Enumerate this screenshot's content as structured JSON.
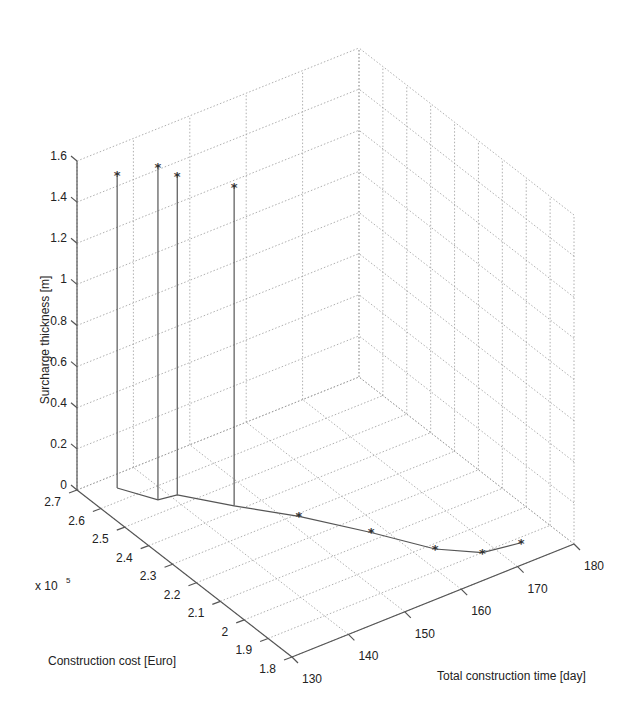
{
  "chart_data": {
    "type": "scatter3d",
    "title": "",
    "xlabel": "Total construction time [day]",
    "ylabel": "Construction cost [Euro]",
    "zlabel": "Surcharge thickness [m]",
    "y_multiplier": "x 10^5",
    "xlim": [
      130,
      180
    ],
    "ylim": [
      1.8,
      2.7
    ],
    "zlim": [
      0,
      1.6
    ],
    "x_ticks": [
      "130",
      "140",
      "150",
      "160",
      "170",
      "180"
    ],
    "y_ticks": [
      "1.8",
      "1.9",
      "2",
      "2.1",
      "2.2",
      "2.3",
      "2.4",
      "2.5",
      "2.6",
      "2.7"
    ],
    "z_ticks": [
      "0",
      "0.2",
      "0.4",
      "0.6",
      "0.8",
      "1",
      "1.2",
      "1.4",
      "1.6"
    ],
    "grid": true,
    "series": [
      {
        "name": "Pareto front",
        "marker": "*",
        "stems": true,
        "points": [
          {
            "time": 135,
            "cost": 2.65,
            "surcharge": 1.52
          },
          {
            "time": 138,
            "cost": 2.55,
            "surcharge": 1.62
          },
          {
            "time": 141,
            "cost": 2.54,
            "surcharge": 1.55
          },
          {
            "time": 146,
            "cost": 2.42,
            "surcharge": 1.55
          },
          {
            "time": 152,
            "cost": 2.29,
            "surcharge": 0
          },
          {
            "time": 158,
            "cost": 2.13,
            "surcharge": 0
          },
          {
            "time": 163,
            "cost": 1.98,
            "surcharge": 0
          },
          {
            "time": 168,
            "cost": 1.9,
            "surcharge": 0
          },
          {
            "time": 174,
            "cost": 1.88,
            "surcharge": 0
          }
        ]
      }
    ]
  },
  "labels": {
    "z_title": "Surcharge thickness [m]",
    "y_title": "Construction cost [Euro]",
    "x_title": "Total construction time [day]",
    "multiplier_base": "x 10",
    "multiplier_exp": "5"
  }
}
